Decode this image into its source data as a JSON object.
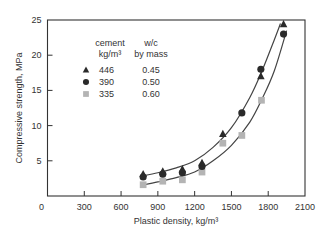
{
  "chart_data": {
    "type": "scatter",
    "title": "",
    "xlabel": "Plastic density, kg/m³",
    "ylabel": "Compressive strength, MPa",
    "xlim": [
      0,
      2100
    ],
    "ylim": [
      0,
      25
    ],
    "xticks": [
      0,
      300,
      600,
      900,
      1200,
      1500,
      1800,
      2100
    ],
    "yticks": [
      5,
      10,
      15,
      20,
      25
    ],
    "grid": false,
    "legend": {
      "position": "upper-left",
      "header_col1": [
        "cement",
        "kg/m³"
      ],
      "header_col2": [
        "w/c",
        "by mass"
      ]
    },
    "series": [
      {
        "name": "446",
        "wc": "0.45",
        "marker": "triangle",
        "color": "#2a2a2a",
        "x": [
          780,
          940,
          1100,
          1260,
          1430,
          1740,
          1925
        ],
        "y": [
          3.1,
          3.5,
          3.8,
          4.7,
          8.8,
          17.0,
          24.4
        ]
      },
      {
        "name": "390",
        "wc": "0.50",
        "marker": "circle",
        "color": "#2a2a2a",
        "x": [
          780,
          940,
          1100,
          1260,
          1585,
          1740,
          1925
        ],
        "y": [
          2.7,
          3.1,
          3.3,
          4.2,
          11.8,
          18.0,
          23.0
        ]
      },
      {
        "name": "335",
        "wc": "0.60",
        "marker": "square",
        "color": "#b4b4b4",
        "x": [
          780,
          940,
          1100,
          1260,
          1430,
          1585,
          1745
        ],
        "y": [
          1.6,
          2.1,
          2.3,
          3.4,
          7.5,
          8.6,
          13.6
        ]
      }
    ],
    "fit_curves": [
      {
        "name": "upper-fit",
        "x": [
          760,
          900,
          1050,
          1200,
          1350,
          1500,
          1650,
          1750,
          1850,
          1900
        ],
        "y": [
          2.8,
          3.3,
          4.0,
          5.0,
          6.9,
          9.7,
          14.0,
          17.8,
          22.2,
          24.5
        ]
      },
      {
        "name": "lower-fit",
        "x": [
          760,
          900,
          1050,
          1200,
          1350,
          1500,
          1650,
          1750,
          1850,
          1950
        ],
        "y": [
          1.5,
          2.0,
          2.6,
          3.4,
          5.0,
          7.2,
          10.5,
          13.8,
          17.8,
          23.5
        ]
      }
    ]
  }
}
